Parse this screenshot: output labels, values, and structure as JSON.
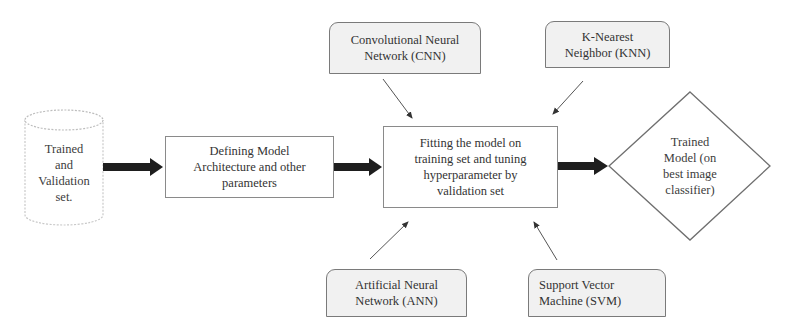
{
  "diagram": {
    "nodes": {
      "dataset": {
        "shape": "cylinder",
        "lines": [
          "Trained",
          "and",
          "Validation",
          "set."
        ]
      },
      "define_model": {
        "shape": "rectangle",
        "lines": [
          "Defining Model",
          "Architecture and other",
          "parameters"
        ]
      },
      "fit_model": {
        "shape": "rectangle",
        "lines": [
          "Fitting the model on",
          "training set and tuning",
          "hyperparameter by",
          "validation set"
        ]
      },
      "trained_model": {
        "shape": "diamond",
        "lines": [
          "Trained",
          "Model (on",
          "best image",
          "classifier)"
        ]
      },
      "cnn": {
        "shape": "rounded-rectangle",
        "lines": [
          "Convolutional Neural",
          "Network (CNN)"
        ]
      },
      "knn": {
        "shape": "rounded-rectangle",
        "lines": [
          "K-Nearest",
          "Neighbor (KNN)"
        ]
      },
      "ann": {
        "shape": "rounded-rectangle",
        "lines": [
          "Artificial Neural",
          "Network (ANN)"
        ]
      },
      "svm": {
        "shape": "rounded-rectangle",
        "lines": [
          "Support Vector",
          "Machine (SVM)"
        ]
      }
    },
    "edges": [
      {
        "from": "dataset",
        "to": "define_model",
        "style": "thick"
      },
      {
        "from": "define_model",
        "to": "fit_model",
        "style": "thick"
      },
      {
        "from": "fit_model",
        "to": "trained_model",
        "style": "thick"
      },
      {
        "from": "cnn",
        "to": "fit_model",
        "style": "thin"
      },
      {
        "from": "knn",
        "to": "fit_model",
        "style": "thin"
      },
      {
        "from": "ann",
        "to": "fit_model",
        "style": "thin"
      },
      {
        "from": "svm",
        "to": "fit_model",
        "style": "thin"
      }
    ],
    "colors": {
      "stroke": "#7a7a7a",
      "thick_arrow": "#1e1e1e",
      "algo_fill": "#f1f1f1",
      "text": "#333333"
    }
  }
}
